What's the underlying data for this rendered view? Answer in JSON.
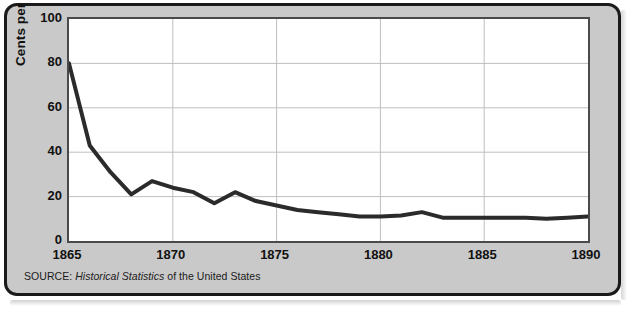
{
  "chart_data": {
    "type": "line",
    "title": "",
    "subtitle": "",
    "xlabel": "",
    "ylabel": "Cents per pound",
    "xlim": [
      1865,
      1890
    ],
    "ylim": [
      0,
      100
    ],
    "grid": true,
    "legend_position": "none",
    "x_ticks": [
      "1865",
      "1870",
      "1875",
      "1880",
      "1885",
      "1890"
    ],
    "x_tick_values": [
      1865,
      1870,
      1875,
      1880,
      1885,
      1890
    ],
    "y_ticks": [
      "0",
      "20",
      "40",
      "60",
      "80",
      "100"
    ],
    "y_tick_values": [
      0,
      20,
      40,
      60,
      80,
      100
    ],
    "x": [
      1865,
      1866,
      1867,
      1868,
      1869,
      1870,
      1871,
      1872,
      1873,
      1874,
      1875,
      1876,
      1877,
      1878,
      1879,
      1880,
      1881,
      1882,
      1883,
      1884,
      1885,
      1886,
      1887,
      1888,
      1889,
      1890
    ],
    "series": [
      {
        "name": "Cotton price",
        "values": [
          80,
          43,
          31,
          21,
          27,
          24,
          22,
          17,
          22,
          18,
          16,
          14,
          13,
          12,
          11,
          11,
          11.5,
          13,
          10.5,
          10.5,
          10.5,
          10.5,
          10.5,
          10,
          10.5,
          11
        ]
      }
    ],
    "line_color": "#2b2b2b",
    "line_width": 4,
    "grid_color": "#bfbfbf",
    "plot_background": "#ffffff",
    "panel_background": "#c9c9c9",
    "border_color": "#1a1a1a"
  },
  "source": {
    "prefix": "SOURCE:",
    "italic_part": "Historical Statistics",
    "suffix": "of the United States"
  }
}
